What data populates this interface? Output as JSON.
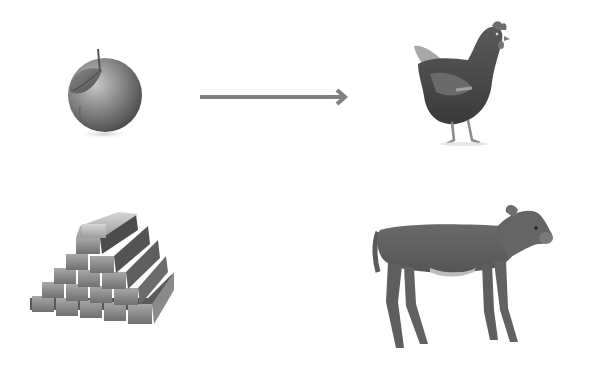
{
  "diagram": {
    "type": "analogy",
    "background": "#ffffff",
    "palette": "grayscale",
    "items": [
      {
        "id": "apple",
        "label": "apple",
        "position": "top-left"
      },
      {
        "id": "chicken",
        "label": "chicken",
        "position": "top-right"
      },
      {
        "id": "gold-bars",
        "label": "stack of gold bars",
        "position": "bottom-left"
      },
      {
        "id": "calf",
        "label": "calf",
        "position": "bottom-right"
      }
    ],
    "connectors": [
      {
        "from": "apple",
        "to": "chicken",
        "style": "arrow",
        "color": "#808080"
      }
    ],
    "icons": [
      "apple-icon",
      "arrow-right-icon",
      "chicken-icon",
      "gold-bars-icon",
      "calf-icon"
    ]
  }
}
